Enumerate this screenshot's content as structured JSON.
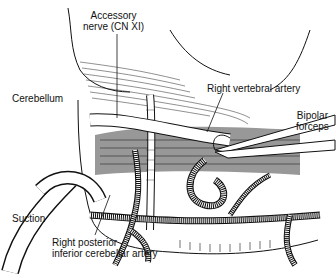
{
  "figure": {
    "type": "anatomical-illustration",
    "labels": {
      "accessory_nerve_line1": "Accessory",
      "accessory_nerve_line2": "nerve (CN XI)",
      "cerebellum": "Cerebellum",
      "right_vertebral_artery": "Right vertebral artery",
      "bipolar_line1": "Bipolar",
      "bipolar_line2": "forceps",
      "suction": "Suction",
      "pica_line1": "Right posterior",
      "pica_line2": "inferior cerebellar artery"
    },
    "colors": {
      "ink": "#111111",
      "background": "#ffffff",
      "shade": "#555555"
    }
  }
}
